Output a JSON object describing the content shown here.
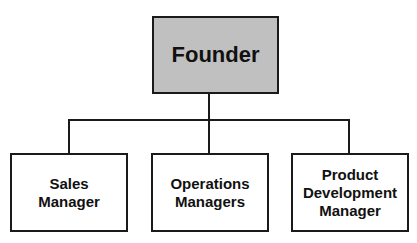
{
  "diagram": {
    "type": "org-chart",
    "root": {
      "label": "Founder",
      "fill": "#c0c0c0"
    },
    "children": [
      {
        "label": "Sales\nManager"
      },
      {
        "label": "Operations\nManagers"
      },
      {
        "label": "Product\nDevelopment\nManager"
      }
    ],
    "colors": {
      "border": "#1a1a1a",
      "child_fill": "#ffffff",
      "background": "#ffffff"
    }
  }
}
